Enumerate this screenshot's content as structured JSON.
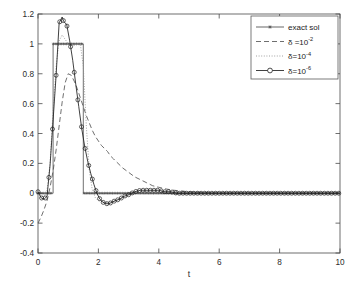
{
  "chart_data": {
    "type": "line",
    "title": "",
    "subtitle": "",
    "xlabel": "t",
    "ylabel": "",
    "xlim": [
      0,
      10
    ],
    "ylim": [
      -0.4,
      1.2
    ],
    "xticks": [
      0,
      2,
      4,
      6,
      8,
      10
    ],
    "xtick_labels": [
      "0",
      "2",
      "4",
      "6",
      "8",
      "10"
    ],
    "yticks": [
      -0.4,
      -0.2,
      0,
      0.2,
      0.4,
      0.6,
      0.8,
      1,
      1.2
    ],
    "ytick_labels": [
      "-0.4",
      "-0.2",
      "0",
      "0.2",
      "0.4",
      "0.6",
      "0.8",
      "1",
      "1.2"
    ],
    "grid": false,
    "legend_position": "top-right",
    "legend_entries": [
      {
        "label": "exact sol",
        "style": "solid-with-star-markers",
        "marker": "star",
        "color": "#404040"
      },
      {
        "label": "δ =10",
        "exponent": "-2",
        "style": "dashed",
        "marker": "none",
        "color": "#404040"
      },
      {
        "label": "δ=10",
        "exponent": "-4",
        "style": "dotted",
        "marker": "none",
        "color": "#707070"
      },
      {
        "label": "δ=10",
        "exponent": "-6",
        "style": "solid-with-circle-markers",
        "marker": "circle",
        "color": "#1a1a1a"
      }
    ],
    "series": [
      {
        "name": "exact sol",
        "description": "Rectangular pulse: value 1 on 0.5 <= t <= 1.5, value 0 elsewhere",
        "style": "solid-with-star-markers",
        "x": [
          0,
          0.1,
          0.2,
          0.3,
          0.4,
          0.5,
          0.5,
          0.6,
          0.7,
          0.8,
          0.9,
          1.0,
          1.1,
          1.2,
          1.3,
          1.4,
          1.5,
          1.5,
          1.6,
          1.8,
          2.0,
          2.5,
          3.0,
          3.5,
          4.0,
          5.0,
          6.0,
          7.0,
          8.0,
          9.0,
          10.0
        ],
        "y": [
          0,
          0,
          0,
          0,
          0,
          0,
          1,
          1,
          1,
          1,
          1,
          1,
          1,
          1,
          1,
          1,
          1,
          0,
          0,
          0,
          0,
          0,
          0,
          0,
          0,
          0,
          0,
          0,
          0,
          0,
          0
        ]
      },
      {
        "name": "delta = 1e-2",
        "description": "Heavily smoothed reconstruction, starts near -0.2 at t=0, peak about 0.80 near t=0.95, slow decay to 0 by t approx 4.5",
        "style": "dashed",
        "x": [
          0.0,
          0.1,
          0.2,
          0.3,
          0.4,
          0.5,
          0.6,
          0.7,
          0.8,
          0.9,
          1.0,
          1.1,
          1.2,
          1.3,
          1.4,
          1.5,
          1.6,
          1.7,
          1.8,
          1.9,
          2.0,
          2.1,
          2.2,
          2.3,
          2.4,
          2.5,
          2.6,
          2.8,
          3.0,
          3.2,
          3.4,
          3.6,
          3.8,
          4.0,
          4.2,
          4.5,
          5.0,
          6.0,
          7.0,
          8.0,
          9.0,
          10.0
        ],
        "y": [
          -0.2,
          -0.16,
          -0.11,
          -0.05,
          0.04,
          0.15,
          0.29,
          0.45,
          0.61,
          0.74,
          0.8,
          0.79,
          0.75,
          0.7,
          0.64,
          0.58,
          0.52,
          0.47,
          0.42,
          0.38,
          0.35,
          0.32,
          0.3,
          0.28,
          0.25,
          0.23,
          0.21,
          0.17,
          0.14,
          0.11,
          0.09,
          0.07,
          0.05,
          0.04,
          0.03,
          0.02,
          0.01,
          0.0,
          0.0,
          0.0,
          0.0,
          0.0
        ]
      },
      {
        "name": "delta = 1e-4",
        "description": "Moderately regularized reconstruction, nearly overlaps the exact pulse edges with mild overshoot",
        "style": "dotted",
        "x": [
          0.0,
          0.1,
          0.2,
          0.3,
          0.4,
          0.5,
          0.6,
          0.7,
          0.8,
          0.9,
          1.0,
          1.1,
          1.2,
          1.3,
          1.4,
          1.5,
          1.6,
          1.7,
          1.8,
          1.9,
          2.0,
          2.2,
          2.4,
          2.6,
          2.8,
          3.0,
          3.4,
          3.8,
          4.2,
          5.0,
          6.0,
          7.0,
          8.0,
          9.0,
          10.0
        ],
        "y": [
          0.0,
          -0.02,
          -0.02,
          0.02,
          0.2,
          0.55,
          0.85,
          1.02,
          1.06,
          1.03,
          1.0,
          0.99,
          0.99,
          1.0,
          1.0,
          0.85,
          0.45,
          0.15,
          0.02,
          -0.03,
          -0.05,
          -0.06,
          -0.06,
          -0.05,
          -0.03,
          -0.01,
          0.01,
          0.02,
          0.01,
          0.0,
          0.0,
          0.0,
          0.0,
          0.0,
          0.0
        ]
      },
      {
        "name": "delta = 1e-6",
        "description": "Lightly regularized reconstruction with circle markers; strong Gibbs overshoot to about 1.18 near t=0.85 and ringing undershoot to about -0.07 near t=2.4",
        "style": "solid-with-circle-markers",
        "x": [
          0.0,
          0.1,
          0.2,
          0.3,
          0.4,
          0.5,
          0.6,
          0.7,
          0.8,
          0.85,
          0.95,
          1.05,
          1.15,
          1.25,
          1.35,
          1.45,
          1.55,
          1.65,
          1.75,
          1.85,
          1.95,
          2.05,
          2.15,
          2.25,
          2.35,
          2.45,
          2.55,
          2.7,
          2.85,
          3.0,
          3.2,
          3.4,
          3.6,
          3.8,
          4.0,
          4.2,
          4.4,
          4.6,
          4.8,
          5.0,
          5.4,
          5.8,
          6.2,
          6.6,
          7.0,
          7.5,
          8.0,
          8.5,
          9.0,
          9.5,
          10.0
        ],
        "y": [
          0.01,
          -0.03,
          -0.04,
          -0.02,
          0.19,
          0.49,
          0.79,
          1.14,
          1.18,
          1.15,
          1.13,
          1.02,
          0.89,
          0.73,
          0.58,
          0.43,
          0.31,
          0.21,
          0.13,
          0.06,
          0.0,
          -0.04,
          -0.06,
          -0.07,
          -0.07,
          -0.06,
          -0.05,
          -0.04,
          -0.02,
          -0.01,
          0.01,
          0.02,
          0.02,
          0.02,
          0.02,
          0.01,
          0.01,
          0.0,
          0.0,
          0.0,
          0.0,
          0.0,
          0.0,
          0.0,
          0.0,
          0.0,
          0.0,
          0.0,
          0.0,
          0.0,
          0.0
        ]
      }
    ]
  }
}
